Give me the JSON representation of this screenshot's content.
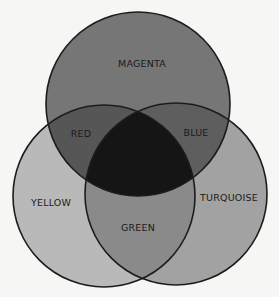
{
  "diagram": {
    "type": "venn",
    "title": "",
    "circles": [
      {
        "id": "magenta",
        "label": "MAGENTA",
        "cx": 138,
        "cy": 104,
        "r": 92,
        "fill": "#767676"
      },
      {
        "id": "yellow",
        "label": "YELLOW",
        "cx": 104,
        "cy": 196,
        "r": 91,
        "fill": "#b9b9b9"
      },
      {
        "id": "turquoise",
        "label": "TURQUOISE",
        "cx": 176,
        "cy": 194,
        "r": 91,
        "fill": "#a2a2a2"
      }
    ],
    "overlaps": [
      {
        "id": "red",
        "label": "RED",
        "sets": [
          "magenta",
          "yellow"
        ],
        "fill": "#565656"
      },
      {
        "id": "blue",
        "label": "BLUE",
        "sets": [
          "magenta",
          "turquoise"
        ],
        "fill": "#5e5e5e"
      },
      {
        "id": "green",
        "label": "GREEN",
        "sets": [
          "yellow",
          "turquoise"
        ],
        "fill": "#8a8a8a"
      },
      {
        "id": "center",
        "label": "",
        "sets": [
          "magenta",
          "yellow",
          "turquoise"
        ],
        "fill": "#151515"
      }
    ],
    "labels": {
      "magenta": "MAGENTA",
      "red": "RED",
      "blue": "BLUE",
      "yellow": "YELLOW",
      "turquoise": "TURQUOISE",
      "green": "GREEN"
    },
    "stroke": "#1c1c1c",
    "background": "#f6f6f4"
  }
}
